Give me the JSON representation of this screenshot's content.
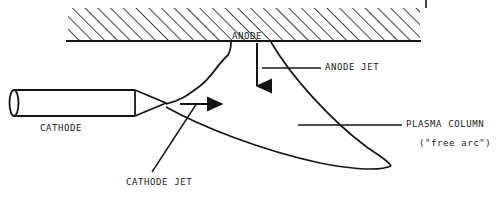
{
  "figure": {
    "background_color": "#ffffff",
    "line_color": "#141414",
    "text_color": "#1a1a1a",
    "width": 497,
    "height": 198
  },
  "labels": {
    "anode": "ANODE",
    "cathode": "CATHODE",
    "anode_jet": "ANODE JET",
    "cathode_jet": "CATHODE JET",
    "plasma_column": "PLASMA COLUMN",
    "free_arc": "(\"free arc\")"
  },
  "parts": {
    "anode_block": {
      "name": "anode-plate",
      "fill": "hatched-45-degree",
      "x": 68,
      "y": 8,
      "width": 352,
      "height": 33,
      "baseline_y": 41
    },
    "cathode_electrode": {
      "name": "cathode-electrode",
      "shape": "cylinder-with-conical-tip",
      "x": 13,
      "y": 90,
      "width": 152,
      "height": 26,
      "tip_x": 165,
      "tip_y": 103
    },
    "plasma_column": {
      "name": "plasma-column-outline",
      "shape": "teardrop",
      "tip_x": 390,
      "tip_y": 166
    },
    "anode_jet_arrow": {
      "name": "anode-jet-arrow",
      "direction": "down",
      "x": 257,
      "from_y": 43,
      "to_y": 88
    },
    "cathode_jet_arrow": {
      "name": "cathode-jet-arrow",
      "direction": "right",
      "y": 104,
      "from_x": 180,
      "to_x": 226
    },
    "corner_tick": {
      "name": "top-corner-tick",
      "x": 426,
      "from_y": 0,
      "to_y": 8
    }
  },
  "leaders": {
    "anode_jet": {
      "from_x": 262,
      "from_y": 68,
      "to_x": 320,
      "to_y": 68
    },
    "plasma_column": {
      "from_x": 298,
      "from_y": 125,
      "to_x": 402,
      "to_y": 125
    },
    "cathode_jet": {
      "from_x": 196,
      "from_y": 104,
      "to_x": 152,
      "to_y": 172
    }
  }
}
